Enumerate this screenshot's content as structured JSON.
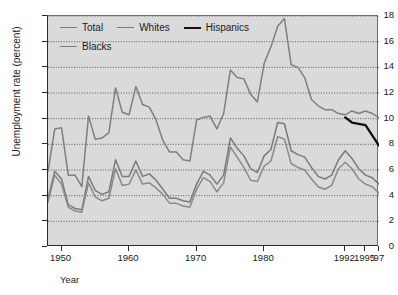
{
  "chart_data": {
    "type": "line",
    "title": "",
    "xlabel": "Year",
    "ylabel": "Unemployment rate (percent)",
    "xlim": [
      1948,
      1997
    ],
    "ylim": [
      0,
      18
    ],
    "ytick_labels": [
      "18",
      "16",
      "14",
      "12",
      "10",
      "8",
      "6",
      "4",
      "2",
      "0"
    ],
    "ytick_values": [
      18,
      16,
      14,
      12,
      10,
      8,
      6,
      4,
      2,
      0
    ],
    "xtick_labels": [
      "1950",
      "1960",
      "1970",
      "1980",
      "1992",
      "1995",
      "'97"
    ],
    "xtick_values": [
      1950,
      1960,
      1970,
      1980,
      1992,
      1995,
      1997
    ],
    "grid": "horizontal-dotted",
    "legend_position": "top-left-inside",
    "plot_background": "#dadada",
    "series": [
      {
        "name": "Total",
        "color": "#7b7b7b",
        "width": 1.5,
        "x": [
          1948,
          1949,
          1950,
          1951,
          1952,
          1953,
          1954,
          1955,
          1956,
          1957,
          1958,
          1959,
          1960,
          1961,
          1962,
          1963,
          1964,
          1965,
          1966,
          1967,
          1968,
          1969,
          1970,
          1971,
          1972,
          1973,
          1974,
          1975,
          1976,
          1977,
          1978,
          1979,
          1980,
          1981,
          1982,
          1983,
          1984,
          1985,
          1986,
          1987,
          1988,
          1989,
          1990,
          1991,
          1992,
          1993,
          1994,
          1995,
          1996,
          1997
        ],
        "values": [
          3.8,
          5.9,
          5.3,
          3.3,
          3.0,
          2.9,
          5.5,
          4.4,
          4.1,
          4.3,
          6.8,
          5.5,
          5.5,
          6.7,
          5.5,
          5.7,
          5.2,
          4.5,
          3.8,
          3.8,
          3.6,
          3.5,
          4.9,
          5.9,
          5.6,
          4.9,
          5.6,
          8.5,
          7.7,
          7.1,
          6.1,
          5.8,
          7.1,
          7.6,
          9.7,
          9.6,
          7.5,
          7.2,
          7.0,
          6.2,
          5.5,
          5.3,
          5.6,
          6.8,
          7.5,
          6.9,
          6.1,
          5.6,
          5.4,
          4.9
        ]
      },
      {
        "name": "Whites",
        "color": "#8a8a8a",
        "width": 1.5,
        "x": [
          1948,
          1949,
          1950,
          1951,
          1952,
          1953,
          1954,
          1955,
          1956,
          1957,
          1958,
          1959,
          1960,
          1961,
          1962,
          1963,
          1964,
          1965,
          1966,
          1967,
          1968,
          1969,
          1970,
          1971,
          1972,
          1973,
          1974,
          1975,
          1976,
          1977,
          1978,
          1979,
          1980,
          1981,
          1982,
          1983,
          1984,
          1985,
          1986,
          1987,
          1988,
          1989,
          1990,
          1991,
          1992,
          1993,
          1994,
          1995,
          1996,
          1997
        ],
        "values": [
          3.5,
          5.6,
          4.9,
          3.1,
          2.8,
          2.7,
          5.0,
          3.9,
          3.6,
          3.8,
          6.1,
          4.8,
          4.9,
          6.0,
          4.9,
          5.0,
          4.6,
          4.1,
          3.4,
          3.4,
          3.2,
          3.1,
          4.5,
          5.4,
          5.1,
          4.3,
          5.0,
          7.8,
          7.0,
          6.2,
          5.2,
          5.1,
          6.3,
          6.7,
          8.6,
          8.4,
          6.5,
          6.2,
          6.0,
          5.3,
          4.7,
          4.5,
          4.8,
          6.1,
          6.6,
          6.1,
          5.3,
          4.9,
          4.7,
          4.2
        ]
      },
      {
        "name": "Blacks",
        "color": "#7f7f7f",
        "width": 1.5,
        "x": [
          1948,
          1949,
          1950,
          1951,
          1952,
          1953,
          1954,
          1955,
          1956,
          1957,
          1958,
          1959,
          1960,
          1961,
          1962,
          1963,
          1964,
          1965,
          1966,
          1967,
          1968,
          1969,
          1970,
          1971,
          1972,
          1973,
          1974,
          1975,
          1976,
          1977,
          1978,
          1979,
          1980,
          1981,
          1982,
          1983,
          1984,
          1985,
          1986,
          1987,
          1988,
          1989,
          1990,
          1991,
          1992,
          1993,
          1994,
          1995,
          1996,
          1997
        ],
        "values": [
          5.9,
          9.2,
          9.3,
          5.6,
          5.6,
          4.7,
          10.2,
          8.4,
          8.5,
          8.9,
          12.4,
          10.5,
          10.3,
          12.5,
          11.1,
          10.9,
          9.9,
          8.3,
          7.4,
          7.4,
          6.8,
          6.7,
          9.9,
          10.1,
          10.2,
          9.2,
          10.4,
          13.8,
          13.2,
          13.1,
          11.9,
          11.3,
          14.3,
          15.6,
          17.2,
          17.8,
          14.2,
          14.0,
          13.2,
          11.5,
          11.0,
          10.7,
          10.7,
          10.4,
          10.3,
          10.6,
          10.4,
          10.6,
          10.4,
          10.1
        ]
      },
      {
        "name": "Hispanics",
        "color": "#111111",
        "width": 2.3,
        "x": [
          1992,
          1993,
          1994,
          1995,
          1996,
          1997
        ],
        "values": [
          10.1,
          9.7,
          9.6,
          9.5,
          8.7,
          7.9
        ]
      }
    ]
  },
  "legend": {
    "rows": [
      [
        {
          "label": "Total",
          "style": "thin"
        },
        {
          "label": "Whites",
          "style": "thin"
        },
        {
          "label": "Hispanics",
          "style": "thick"
        }
      ],
      [
        {
          "label": "Blacks",
          "style": "thin"
        }
      ]
    ]
  }
}
